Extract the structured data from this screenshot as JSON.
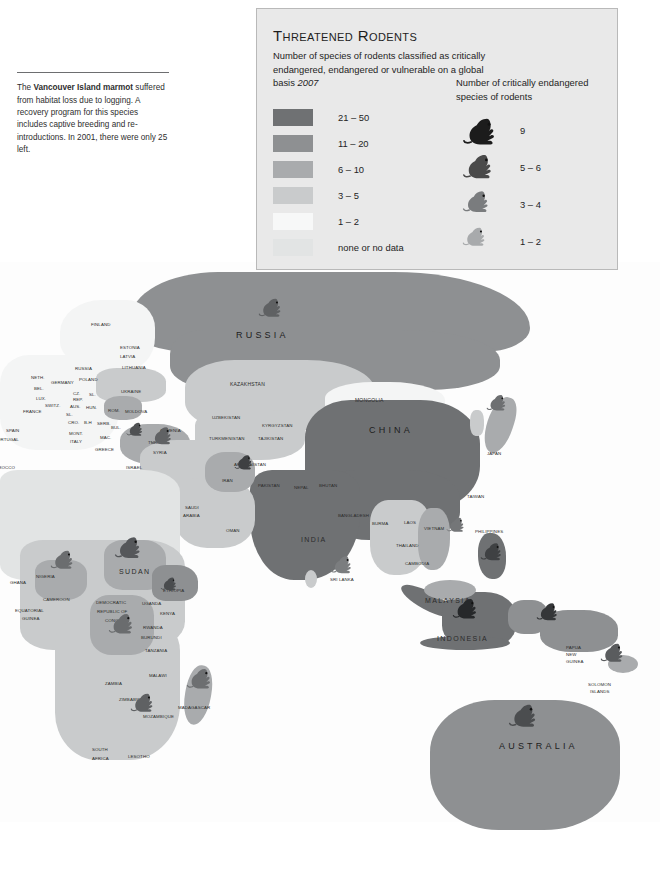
{
  "caption": {
    "text_before": "The ",
    "bold": "Vancouver Island marmot",
    "text_after": " suffered from habitat loss due to logging. A recovery program for this species includes captive breeding and re-introductions. In 2001, there were only 25 left."
  },
  "legend": {
    "title": "Threatened Rodents",
    "subtitle": "Number of species of rodents classified as critically endangered, endangered or vulnerable on a global basis ",
    "year": "2007",
    "swatches": [
      {
        "label": "21 – 50",
        "color": "#6f7173"
      },
      {
        "label": "11 – 20",
        "color": "#8e9092"
      },
      {
        "label": "6 – 10",
        "color": "#a9abad"
      },
      {
        "label": "3 – 5",
        "color": "#c9cbcc"
      },
      {
        "label": "1 – 2",
        "color": "#f7f8f8"
      },
      {
        "label": "none or no data",
        "color": "#e2e4e4"
      }
    ],
    "mice_title": "Number of critically endangered species of rodents",
    "mice": [
      {
        "label": "9",
        "color": "#1c1c1c"
      },
      {
        "label": "5 – 6",
        "color": "#4a4a4a"
      },
      {
        "label": "3 – 4",
        "color": "#7a7c7e"
      },
      {
        "label": "1 – 2",
        "color": "#a8aaac"
      }
    ]
  },
  "chart_data": {
    "type": "map",
    "title": "Threatened Rodents",
    "subtitle": "Number of species of rodents classified as critically endangered, endangered or vulnerable on a global basis",
    "year": "2007",
    "projection": "world (eastern hemisphere view)",
    "choropleth_scale": [
      "21 – 50",
      "11 – 20",
      "6 – 10",
      "3 – 5",
      "1 – 2",
      "none or no data"
    ],
    "symbol_scale": [
      "9",
      "5 – 6",
      "3 – 4",
      "1 – 2"
    ]
  },
  "map": {
    "labels": [
      {
        "t": "RUSSIA",
        "x": 236,
        "y": 330,
        "cls": "lbl-big"
      },
      {
        "t": "CHINA",
        "x": 369,
        "y": 425,
        "cls": "lbl-big"
      },
      {
        "t": "INDIA",
        "x": 301,
        "y": 536,
        "cls": "lbl-mid"
      },
      {
        "t": "AUSTRALIA",
        "x": 499,
        "y": 741,
        "cls": "lbl-big"
      },
      {
        "t": "INDONESIA",
        "x": 437,
        "y": 635,
        "cls": "lbl-mid"
      },
      {
        "t": "MALAYSIA",
        "x": 425,
        "y": 597,
        "cls": "lbl-mid"
      },
      {
        "t": "MONGOLIA",
        "x": 355,
        "y": 397,
        "cls": "lbl-sm"
      },
      {
        "t": "KAZAKHSTAN",
        "x": 230,
        "y": 381,
        "cls": "lbl-sm"
      },
      {
        "t": "FINLAND",
        "x": 91,
        "y": 322,
        "cls": "lbl-xs"
      },
      {
        "t": "ESTONIA",
        "x": 120,
        "y": 345,
        "cls": "lbl-xs"
      },
      {
        "t": "LATVIA",
        "x": 120,
        "y": 354,
        "cls": "lbl-xs"
      },
      {
        "t": "LITHUANIA",
        "x": 122,
        "y": 365,
        "cls": "lbl-xs"
      },
      {
        "t": "RUSSIA",
        "x": 75,
        "y": 366,
        "cls": "lbl-xs"
      },
      {
        "t": "NETH.",
        "x": 31,
        "y": 375,
        "cls": "lbl-xs"
      },
      {
        "t": "GERMANY",
        "x": 51,
        "y": 380,
        "cls": "lbl-xs"
      },
      {
        "t": "POLAND",
        "x": 79,
        "y": 377,
        "cls": "lbl-xs"
      },
      {
        "t": "BEL.",
        "x": 34,
        "y": 386,
        "cls": "lbl-xs"
      },
      {
        "t": "LUX.",
        "x": 36,
        "y": 396,
        "cls": "lbl-xs"
      },
      {
        "t": "CZ.",
        "x": 73,
        "y": 391,
        "cls": "lbl-xs"
      },
      {
        "t": "REP.",
        "x": 73,
        "y": 397,
        "cls": "lbl-xs"
      },
      {
        "t": "SL.",
        "x": 89,
        "y": 392,
        "cls": "lbl-xs"
      },
      {
        "t": "AUS.",
        "x": 70,
        "y": 404,
        "cls": "lbl-xs"
      },
      {
        "t": "HUN.",
        "x": 86,
        "y": 405,
        "cls": "lbl-xs"
      },
      {
        "t": "SWITZ.",
        "x": 45,
        "y": 403,
        "cls": "lbl-xs"
      },
      {
        "t": "FRANCE",
        "x": 23,
        "y": 409,
        "cls": "lbl-xs"
      },
      {
        "t": "SL.",
        "x": 66,
        "y": 412,
        "cls": "lbl-xs"
      },
      {
        "t": "CRO.",
        "x": 68,
        "y": 420,
        "cls": "lbl-xs"
      },
      {
        "t": "B-H",
        "x": 84,
        "y": 420,
        "cls": "lbl-xs"
      },
      {
        "t": "SERB.",
        "x": 97,
        "y": 421,
        "cls": "lbl-xs"
      },
      {
        "t": "ROM.",
        "x": 108,
        "y": 408,
        "cls": "lbl-xs"
      },
      {
        "t": "BUL.",
        "x": 111,
        "y": 425,
        "cls": "lbl-xs"
      },
      {
        "t": "MOLDOVA",
        "x": 125,
        "y": 409,
        "cls": "lbl-xs"
      },
      {
        "t": "UKRAINE",
        "x": 121,
        "y": 389,
        "cls": "lbl-xs"
      },
      {
        "t": "MONT.",
        "x": 69,
        "y": 431,
        "cls": "lbl-xs"
      },
      {
        "t": "MAC.",
        "x": 100,
        "y": 435,
        "cls": "lbl-xs"
      },
      {
        "t": "ITALY",
        "x": 70,
        "y": 439,
        "cls": "lbl-xs"
      },
      {
        "t": "GREECE",
        "x": 95,
        "y": 447,
        "cls": "lbl-xs"
      },
      {
        "t": "SPAIN",
        "x": 6,
        "y": 428,
        "cls": "lbl-xs"
      },
      {
        "t": "PORTUGAL",
        "x": -6,
        "y": 437,
        "cls": "lbl-xs"
      },
      {
        "t": "MOROCCO",
        "x": -9,
        "y": 465,
        "cls": "lbl-xs"
      },
      {
        "t": "TURKEY",
        "x": 148,
        "y": 440,
        "cls": "lbl-xs"
      },
      {
        "t": "ARMENIA",
        "x": 160,
        "y": 428,
        "cls": "lbl-xs"
      },
      {
        "t": "SYRIA",
        "x": 153,
        "y": 450,
        "cls": "lbl-xs"
      },
      {
        "t": "ISRAEL",
        "x": 126,
        "y": 465,
        "cls": "lbl-xs"
      },
      {
        "t": "UZBEKISTAN",
        "x": 212,
        "y": 415,
        "cls": "lbl-xs"
      },
      {
        "t": "KYRGYZSTAN",
        "x": 262,
        "y": 423,
        "cls": "lbl-xs"
      },
      {
        "t": "TURKMENISTAN",
        "x": 209,
        "y": 436,
        "cls": "lbl-xs"
      },
      {
        "t": "TAJIKISTAN",
        "x": 258,
        "y": 436,
        "cls": "lbl-xs"
      },
      {
        "t": "AFGHANISTAN",
        "x": 234,
        "y": 462,
        "cls": "lbl-xs"
      },
      {
        "t": "IRAN",
        "x": 222,
        "y": 478,
        "cls": "lbl-xs"
      },
      {
        "t": "PAKISTAN",
        "x": 258,
        "y": 483,
        "cls": "lbl-xs"
      },
      {
        "t": "SAUDI",
        "x": 185,
        "y": 505,
        "cls": "lbl-xs"
      },
      {
        "t": "ARABIA",
        "x": 183,
        "y": 513,
        "cls": "lbl-xs"
      },
      {
        "t": "OMAN",
        "x": 226,
        "y": 528,
        "cls": "lbl-xs"
      },
      {
        "t": "NEPAL",
        "x": 294,
        "y": 485,
        "cls": "lbl-xs"
      },
      {
        "t": "BHUTAN",
        "x": 319,
        "y": 483,
        "cls": "lbl-xs"
      },
      {
        "t": "BANGLADESH",
        "x": 338,
        "y": 513,
        "cls": "lbl-xs"
      },
      {
        "t": "BURMA",
        "x": 372,
        "y": 521,
        "cls": "lbl-xs"
      },
      {
        "t": "LAOS",
        "x": 404,
        "y": 520,
        "cls": "lbl-xs"
      },
      {
        "t": "VIETNAM",
        "x": 424,
        "y": 526,
        "cls": "lbl-xs"
      },
      {
        "t": "THAILAND",
        "x": 396,
        "y": 543,
        "cls": "lbl-xs"
      },
      {
        "t": "CAMBODIA",
        "x": 405,
        "y": 561,
        "cls": "lbl-xs"
      },
      {
        "t": "SRI LANKA",
        "x": 330,
        "y": 577,
        "cls": "lbl-xs"
      },
      {
        "t": "TAIWAN",
        "x": 467,
        "y": 494,
        "cls": "lbl-xs"
      },
      {
        "t": "JAPAN",
        "x": 487,
        "y": 451,
        "cls": "lbl-xs"
      },
      {
        "t": "PHILIPPINES",
        "x": 475,
        "y": 529,
        "cls": "lbl-xs"
      },
      {
        "t": "PAPUA",
        "x": 566,
        "y": 645,
        "cls": "lbl-xs"
      },
      {
        "t": "NEW",
        "x": 566,
        "y": 652,
        "cls": "lbl-xs"
      },
      {
        "t": "GUINEA",
        "x": 566,
        "y": 659,
        "cls": "lbl-xs"
      },
      {
        "t": "SOLOMON",
        "x": 588,
        "y": 682,
        "cls": "lbl-xs"
      },
      {
        "t": "ISLANDS",
        "x": 590,
        "y": 689,
        "cls": "lbl-xs"
      },
      {
        "t": "NIGERIA",
        "x": 36,
        "y": 574,
        "cls": "lbl-xs"
      },
      {
        "t": "CAMEROON",
        "x": 43,
        "y": 597,
        "cls": "lbl-xs"
      },
      {
        "t": "GHANA",
        "x": 10,
        "y": 580,
        "cls": "lbl-xs"
      },
      {
        "t": "EQUATORIAL",
        "x": 15,
        "y": 608,
        "cls": "lbl-xs"
      },
      {
        "t": "GUINEA",
        "x": 22,
        "y": 616,
        "cls": "lbl-xs"
      },
      {
        "t": "SUDAN",
        "x": 119,
        "y": 568,
        "cls": "lbl-mid"
      },
      {
        "t": "ETHIOPIA",
        "x": 163,
        "y": 588,
        "cls": "lbl-xs"
      },
      {
        "t": "DEMOCRATIC",
        "x": 96,
        "y": 600,
        "cls": "lbl-xs"
      },
      {
        "t": "REPUBLIC OF",
        "x": 97,
        "y": 609,
        "cls": "lbl-xs"
      },
      {
        "t": "CONGO",
        "x": 105,
        "y": 618,
        "cls": "lbl-xs"
      },
      {
        "t": "UGANDA",
        "x": 142,
        "y": 601,
        "cls": "lbl-xs"
      },
      {
        "t": "KENYA",
        "x": 160,
        "y": 611,
        "cls": "lbl-xs"
      },
      {
        "t": "RWANDA",
        "x": 143,
        "y": 625,
        "cls": "lbl-xs"
      },
      {
        "t": "BURUNDI",
        "x": 141,
        "y": 635,
        "cls": "lbl-xs"
      },
      {
        "t": "TANZANIA",
        "x": 145,
        "y": 648,
        "cls": "lbl-xs"
      },
      {
        "t": "MALAWI",
        "x": 149,
        "y": 673,
        "cls": "lbl-xs"
      },
      {
        "t": "ZAMBIA",
        "x": 105,
        "y": 681,
        "cls": "lbl-xs"
      },
      {
        "t": "ZIMBABWE",
        "x": 119,
        "y": 697,
        "cls": "lbl-xs"
      },
      {
        "t": "MOZAMBIQUE",
        "x": 143,
        "y": 714,
        "cls": "lbl-xs"
      },
      {
        "t": "MADAGASCAR",
        "x": 178,
        "y": 705,
        "cls": "lbl-xs"
      },
      {
        "t": "SOUTH",
        "x": 92,
        "y": 747,
        "cls": "lbl-xs"
      },
      {
        "t": "AFRICA",
        "x": 92,
        "y": 756,
        "cls": "lbl-xs"
      },
      {
        "t": "LESOTHO",
        "x": 128,
        "y": 754,
        "cls": "lbl-xs"
      }
    ]
  }
}
